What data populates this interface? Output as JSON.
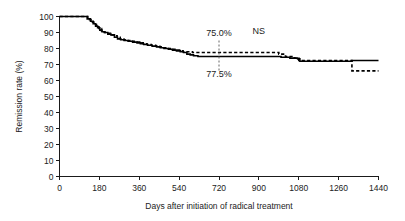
{
  "chart_data": {
    "type": "line",
    "title": "",
    "xlabel": "Days after initiation of radical treatment",
    "ylabel": "Remission rate (%)",
    "xlim": [
      0,
      1440
    ],
    "ylim": [
      0,
      100
    ],
    "grid": false,
    "legend_position": "none",
    "x_ticks": [
      0,
      180,
      360,
      540,
      720,
      900,
      1080,
      1260,
      1440
    ],
    "x_tick_labels": [
      "0",
      "180",
      "360",
      "540",
      "720",
      "900",
      "1080",
      "1260",
      "1440"
    ],
    "y_ticks": [
      0,
      10,
      20,
      30,
      40,
      50,
      60,
      70,
      80,
      90,
      100
    ],
    "y_tick_labels": [
      "0",
      "10",
      "20",
      "30",
      "40",
      "50",
      "60",
      "70",
      "80",
      "90",
      "100"
    ],
    "annotations": [
      {
        "name": "upper-value",
        "text": "75.0%",
        "x": 720,
        "y": 88
      },
      {
        "name": "lower-value",
        "text": "77.5%",
        "x": 720,
        "y": 62
      },
      {
        "name": "significance",
        "text": "NS",
        "x": 900,
        "y": 89
      },
      {
        "name": "reference-line",
        "text": "",
        "x": 720,
        "y_from": 66,
        "y_to": 85
      }
    ],
    "series": [
      {
        "name": "solid-curve",
        "style": "solid",
        "value_at_720": 75.0,
        "points": [
          [
            0,
            100
          ],
          [
            110,
            100
          ],
          [
            125,
            98.5
          ],
          [
            140,
            97
          ],
          [
            152,
            95.5
          ],
          [
            163,
            94
          ],
          [
            172,
            93
          ],
          [
            182,
            91.5
          ],
          [
            192,
            90.5
          ],
          [
            205,
            90
          ],
          [
            218,
            89
          ],
          [
            232,
            88.5
          ],
          [
            248,
            87
          ],
          [
            262,
            86
          ],
          [
            276,
            85.5
          ],
          [
            292,
            85
          ],
          [
            310,
            84.5
          ],
          [
            330,
            84
          ],
          [
            350,
            83.5
          ],
          [
            365,
            83
          ],
          [
            380,
            82.5
          ],
          [
            398,
            82
          ],
          [
            418,
            81.5
          ],
          [
            438,
            81
          ],
          [
            455,
            80.5
          ],
          [
            472,
            80
          ],
          [
            492,
            79.5
          ],
          [
            510,
            79
          ],
          [
            528,
            78.5
          ],
          [
            545,
            78
          ],
          [
            560,
            77.5
          ],
          [
            575,
            76.5
          ],
          [
            590,
            76
          ],
          [
            605,
            75.5
          ],
          [
            625,
            75
          ],
          [
            660,
            75
          ],
          [
            720,
            75
          ],
          [
            800,
            75
          ],
          [
            880,
            75
          ],
          [
            960,
            75
          ],
          [
            1000,
            74.5
          ],
          [
            1040,
            74
          ],
          [
            1075,
            73.5
          ],
          [
            1085,
            72
          ],
          [
            1140,
            72
          ],
          [
            1220,
            72
          ],
          [
            1300,
            72
          ],
          [
            1320,
            72.5
          ],
          [
            1400,
            72.5
          ],
          [
            1440,
            72.5
          ]
        ]
      },
      {
        "name": "dashed-curve",
        "style": "dashed",
        "value_at_720": 77.5,
        "points": [
          [
            0,
            100
          ],
          [
            112,
            100
          ],
          [
            128,
            98
          ],
          [
            142,
            96.5
          ],
          [
            155,
            95
          ],
          [
            167,
            93.5
          ],
          [
            178,
            92.5
          ],
          [
            190,
            91
          ],
          [
            202,
            90
          ],
          [
            215,
            89.5
          ],
          [
            230,
            88.5
          ],
          [
            245,
            88
          ],
          [
            260,
            87
          ],
          [
            274,
            86
          ],
          [
            290,
            85.5
          ],
          [
            308,
            85
          ],
          [
            326,
            84.5
          ],
          [
            345,
            84
          ],
          [
            362,
            83.5
          ],
          [
            378,
            83
          ],
          [
            395,
            82.5
          ],
          [
            414,
            82
          ],
          [
            434,
            81.5
          ],
          [
            452,
            81
          ],
          [
            470,
            80.5
          ],
          [
            490,
            80
          ],
          [
            508,
            79.5
          ],
          [
            526,
            79
          ],
          [
            542,
            78.5
          ],
          [
            558,
            78
          ],
          [
            575,
            78
          ],
          [
            600,
            77.5
          ],
          [
            640,
            77.5
          ],
          [
            680,
            77.5
          ],
          [
            720,
            77.5
          ],
          [
            780,
            77.5
          ],
          [
            840,
            77.5
          ],
          [
            900,
            77.5
          ],
          [
            950,
            77.5
          ],
          [
            990,
            76.5
          ],
          [
            1020,
            75
          ],
          [
            1060,
            74
          ],
          [
            1080,
            72.5
          ],
          [
            1120,
            72.5
          ],
          [
            1180,
            72.5
          ],
          [
            1240,
            72.5
          ],
          [
            1290,
            72.5
          ],
          [
            1310,
            72.5
          ],
          [
            1320,
            66
          ],
          [
            1380,
            66
          ],
          [
            1440,
            66
          ]
        ]
      }
    ]
  }
}
